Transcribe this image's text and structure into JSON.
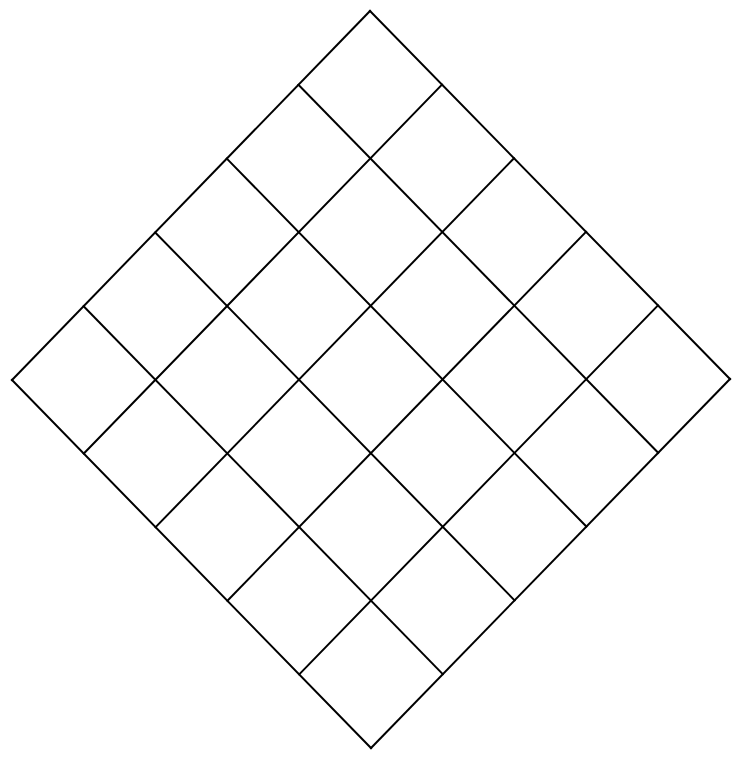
{
  "diagram": {
    "type": "rotated-square-grid",
    "rows": 5,
    "cols": 5,
    "vertices": {
      "top": [
        370,
        11
      ],
      "right": [
        730,
        379
      ],
      "bottom": [
        371,
        748
      ],
      "left": [
        12,
        380
      ]
    },
    "stroke_color": "#000000",
    "stroke_width": 2,
    "background": "#ffffff"
  }
}
